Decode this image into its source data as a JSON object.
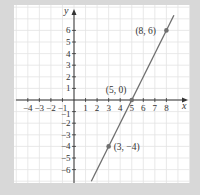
{
  "chart_data": {
    "type": "line",
    "title": "",
    "xlabel": "x",
    "ylabel": "y",
    "xlim": [
      -4.5,
      9.5
    ],
    "ylim": [
      -7,
      7.5
    ],
    "grid": true,
    "x_ticks": [
      -4,
      -3,
      -2,
      -1,
      1,
      2,
      3,
      4,
      5,
      6,
      7,
      8
    ],
    "y_ticks": [
      -6,
      -5,
      -4,
      -3,
      -2,
      -1,
      1,
      2,
      3,
      4,
      5,
      6
    ],
    "x_tick_labels": [
      "−4",
      "−3",
      "−2",
      "−1",
      "1",
      "2",
      "3",
      "4",
      "5",
      "6",
      "7",
      "8"
    ],
    "y_tick_labels": [
      "−6",
      "−5",
      "−4",
      "−3",
      "−2",
      "−1",
      "1",
      "2",
      "3",
      "4",
      "5",
      "6"
    ],
    "series": [
      {
        "name": "line",
        "equation": "y = 2x - 10",
        "x": [
          1.5,
          8.65
        ],
        "y": [
          -7,
          7.3
        ]
      }
    ],
    "points": [
      {
        "x": 8,
        "y": 6,
        "label": "(8, 6)"
      },
      {
        "x": 5,
        "y": 0,
        "label": "(5, 0)"
      },
      {
        "x": 3,
        "y": -4,
        "label": "(3, −4)"
      }
    ],
    "colors": {
      "background": "#d8d8d8",
      "panel": "#ffffff",
      "grid": "#e3e3e3",
      "axis": "#333333",
      "line": "#6e6e6e"
    }
  }
}
